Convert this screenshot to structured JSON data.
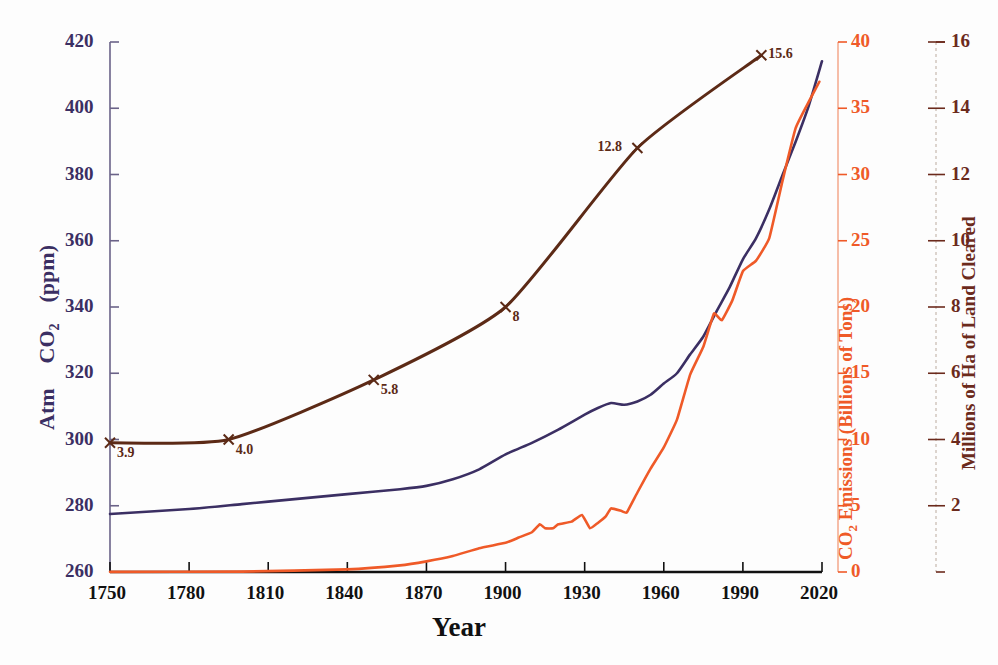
{
  "chart_data": {
    "type": "line",
    "title": "",
    "xlabel": "Year",
    "grid": false,
    "legend_position": "none",
    "x_axis": {
      "label": "Year",
      "ticks": [
        1750,
        1780,
        1810,
        1840,
        1870,
        1900,
        1930,
        1960,
        1990,
        2020
      ],
      "range": [
        1750,
        2020
      ]
    },
    "axes": [
      {
        "id": "left",
        "label": "Atm   CO2   (ppm)",
        "label_parts": [
          "Atm",
          "CO",
          "2",
          "(ppm)"
        ],
        "color": "#3b2f63",
        "ticks": [
          260,
          280,
          300,
          320,
          340,
          360,
          380,
          400,
          420
        ],
        "range": [
          260,
          420
        ]
      },
      {
        "id": "right-inner",
        "label": "CO2 Emissions (Billions of Tons)",
        "label_parts": [
          "CO",
          "2",
          " Emissions (Billions of Tons)"
        ],
        "color": "#ef5a28",
        "ticks": [
          0,
          5,
          10,
          15,
          20,
          25,
          30,
          35,
          40
        ],
        "range": [
          0,
          40
        ]
      },
      {
        "id": "right-outer",
        "label": "Millions of Ha of Land Cleared",
        "color": "#6b2a1c",
        "ticks": [
          2,
          4,
          6,
          8,
          10,
          12,
          14,
          16
        ],
        "range": [
          0,
          16
        ]
      }
    ],
    "series": [
      {
        "name": "Atmospheric CO2 (ppm)",
        "axis": "left",
        "color": "#3b2f63",
        "unit": "ppm",
        "x": [
          1750,
          1780,
          1800,
          1820,
          1840,
          1860,
          1870,
          1880,
          1890,
          1900,
          1910,
          1920,
          1930,
          1935,
          1940,
          1945,
          1950,
          1955,
          1960,
          1965,
          1970,
          1975,
          1980,
          1985,
          1990,
          1995,
          2000,
          2005,
          2010,
          2015,
          2020
        ],
        "y": [
          277.5,
          279.0,
          280.5,
          282.0,
          283.5,
          285.0,
          286.0,
          288.0,
          291.0,
          295.5,
          299.0,
          303.0,
          307.5,
          309.5,
          311.0,
          310.5,
          311.5,
          313.5,
          316.9,
          320.0,
          325.7,
          331.1,
          338.7,
          346.0,
          354.4,
          360.8,
          369.5,
          379.8,
          389.9,
          400.8,
          414.2
        ]
      },
      {
        "name": "CO2 Emissions (Billions of Tons)",
        "axis": "right-inner",
        "color": "#ef5a28",
        "unit": "billions of tons",
        "x": [
          1750,
          1800,
          1840,
          1860,
          1870,
          1880,
          1890,
          1900,
          1905,
          1910,
          1913,
          1915,
          1918,
          1920,
          1925,
          1929,
          1932,
          1935,
          1938,
          1940,
          1944,
          1946,
          1950,
          1955,
          1960,
          1965,
          1970,
          1975,
          1979,
          1982,
          1986,
          1990,
          1995,
          2000,
          2005,
          2010,
          2015,
          2019
        ],
        "y": [
          0.01,
          0.03,
          0.2,
          0.5,
          0.8,
          1.2,
          1.8,
          2.2,
          2.6,
          3.0,
          3.6,
          3.3,
          3.3,
          3.6,
          3.8,
          4.3,
          3.3,
          3.7,
          4.2,
          4.8,
          4.6,
          4.5,
          6.0,
          7.8,
          9.4,
          11.5,
          14.9,
          17.0,
          19.5,
          19.0,
          20.5,
          22.7,
          23.5,
          25.2,
          29.5,
          33.5,
          35.5,
          37.0
        ]
      },
      {
        "name": "Millions of Ha of Land Cleared",
        "axis": "right-outer",
        "color": "#5c2a16",
        "unit": "millions of ha",
        "x": [
          1750,
          1795,
          1850,
          1900,
          1950,
          1997
        ],
        "y": [
          3.9,
          4.0,
          5.8,
          8.0,
          12.8,
          15.6
        ],
        "annotations": [
          {
            "x": 1750,
            "y": 3.9,
            "text": "3.9",
            "side": "right"
          },
          {
            "x": 1795,
            "y": 4.0,
            "text": "4.0",
            "side": "right"
          },
          {
            "x": 1850,
            "y": 5.8,
            "text": "5.8",
            "side": "right"
          },
          {
            "x": 1900,
            "y": 8.0,
            "text": "8",
            "side": "right"
          },
          {
            "x": 1950,
            "y": 12.8,
            "text": "12.8",
            "side": "left"
          },
          {
            "x": 1997,
            "y": 15.6,
            "text": "15.6",
            "side": "right"
          }
        ]
      }
    ]
  },
  "labels": {
    "left_axis_title_1": "Atm",
    "left_axis_title_2": "CO",
    "left_axis_title_sub": "2",
    "left_axis_title_3": "(ppm)",
    "x_axis_title": "Year",
    "orange_axis_title_1": "CO",
    "orange_axis_title_sub": "2",
    "orange_axis_title_2": " Emissions (Billions of Tons)",
    "brown_axis_title": "Millions of Ha of Land Cleared"
  },
  "colors": {
    "co2_ppm": "#3b2f63",
    "emissions": "#ef5a28",
    "land_cleared": "#5c2a16",
    "axis_black": "#111111"
  }
}
